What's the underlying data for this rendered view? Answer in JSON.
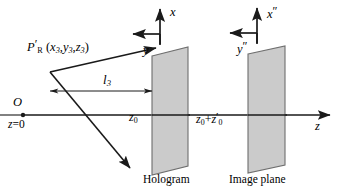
{
  "figure": {
    "background_color": "#ffffff",
    "line_color": "#1a1a1a",
    "plane_fill_color": "#cbcbcb",
    "plane_stroke_color": "#6e6e6e"
  },
  "labels": {
    "point_source": "P′R (x3,y3,z3)",
    "distance_l3": "l3",
    "origin": "O",
    "origin_plane": "z=0",
    "hologram_distance": "z0",
    "image_distance": "z0+z′0",
    "z_axis": "z",
    "hologram_x_axis": "x",
    "hologram_y_axis": "y",
    "image_x_axis": "x″",
    "image_y_axis": "y″",
    "hologram_caption": "Hologram",
    "image_plane_caption": "Image plane"
  },
  "geometry": {
    "z_axis": {
      "x1": 22,
      "y1": 115,
      "x2": 332,
      "y2": 115
    },
    "origin_dot": {
      "cx": 23,
      "cy": 115,
      "r": 2.1
    },
    "zero_plane_line": {
      "x1": 0,
      "y1": 115,
      "x2": 22,
      "y2": 115
    },
    "point_source_vertex": {
      "x": 50,
      "y": 72
    },
    "ray_upper": {
      "x1": 50,
      "y1": 72,
      "x2": 158,
      "y2": 47
    },
    "ray_lower": {
      "x1": 50,
      "y1": 72,
      "x2": 130,
      "y2": 168
    },
    "l3_arrow": {
      "x1": 48,
      "y1": 91,
      "x2": 153,
      "y2": 91
    },
    "hologram_plane": {
      "points": "152,56 188,47 188,166 152,175",
      "center_x": 170
    },
    "image_plane": {
      "points": "248,54 285,46 285,165 248,173",
      "center_x": 266
    },
    "hologram_axes": {
      "origin_x": 160,
      "origin_y": 44,
      "x_tip_x": 160,
      "x_tip_y": 7,
      "y_tip_x": 131,
      "y_tip_y": 34
    },
    "image_axes": {
      "origin_x": 257,
      "origin_y": 43,
      "x_tip_x": 257,
      "x_tip_y": 6,
      "y_tip_x": 228,
      "y_tip_y": 33
    },
    "hologram_tick": {
      "x": 152,
      "y_top": 108,
      "y_bot": 122
    },
    "image_tick": {
      "x": 248,
      "y_top": 108,
      "y_bot": 122
    }
  }
}
